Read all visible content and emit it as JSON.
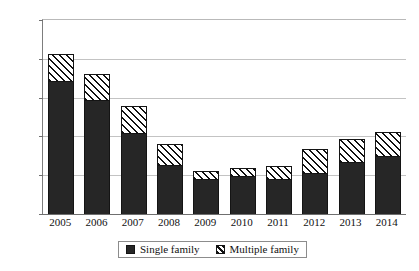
{
  "chart_data": {
    "type": "bar",
    "barmode": "stacked",
    "title": "",
    "subtitle": "",
    "xlabel": "",
    "ylabel": "",
    "categories": [
      "2005",
      "2006",
      "2007",
      "2008",
      "2009",
      "2010",
      "2011",
      "2012",
      "2013",
      "2014"
    ],
    "series": [
      {
        "name": "Single family",
        "style": "solid-black",
        "color": "#262626",
        "values": [
          1715,
          1470,
          1045,
          630,
          450,
          490,
          450,
          530,
          670,
          750
        ]
      },
      {
        "name": "Multiple family",
        "style": "diagonal-hatch",
        "color": "#ffffff",
        "values": [
          345,
          335,
          345,
          270,
          105,
          100,
          165,
          310,
          300,
          310
        ]
      }
    ],
    "totals": [
      2060,
      1805,
      1390,
      900,
      555,
      590,
      615,
      840,
      970,
      1060
    ],
    "ylim": [
      0,
      2500
    ],
    "yticks": [
      0,
      500,
      1000,
      1500,
      2000,
      2500
    ],
    "ytick_labels": [
      "0",
      "500",
      "1000",
      "1500",
      "2000",
      "2500"
    ],
    "grid": true,
    "grid_axis": "y",
    "legend_position": "bottom-center",
    "legend_entries": [
      "Single family",
      "Multiple family"
    ]
  },
  "legend": {
    "single_label": "Single family",
    "multiple_label": "Multiple family"
  }
}
